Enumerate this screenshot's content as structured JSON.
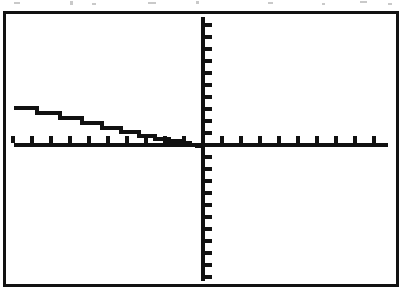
{
  "screen": {
    "label": "graphing-calculator-screen",
    "width": 406,
    "height": 300,
    "background_color": "#ffffff",
    "frame_color": "#121212",
    "frame_border_width": 3,
    "trace_color": "#111111",
    "axis_color": "#111111",
    "caption": "Graphing calculator display showing a decreasing step function in the second quadrant"
  },
  "artifacts": {
    "description": "faint grey scanner speckles along the top edge of the page",
    "color": "#c9c9c9",
    "specks": [
      {
        "x": 14,
        "y": 2,
        "w": 6,
        "h": 2
      },
      {
        "x": 70,
        "y": 1,
        "w": 3,
        "h": 4
      },
      {
        "x": 92,
        "y": 3,
        "w": 4,
        "h": 2
      },
      {
        "x": 148,
        "y": 2,
        "w": 8,
        "h": 2
      },
      {
        "x": 196,
        "y": 1,
        "w": 3,
        "h": 3
      },
      {
        "x": 268,
        "y": 2,
        "w": 5,
        "h": 2
      },
      {
        "x": 322,
        "y": 3,
        "w": 3,
        "h": 2
      },
      {
        "x": 360,
        "y": 1,
        "w": 7,
        "h": 2
      },
      {
        "x": 388,
        "y": 3,
        "w": 4,
        "h": 2
      }
    ]
  },
  "chart_data": {
    "type": "line",
    "title": "",
    "subtitle": "",
    "xlabel": "",
    "ylabel": "",
    "legend": [],
    "legend_position": "none",
    "grid": false,
    "axes_visible": true,
    "origin_px": {
      "x": 197,
      "y": 131
    },
    "xlim": [
      -10.2,
      10.2
    ],
    "ylim": [
      -11.5,
      11.5
    ],
    "x_tick_interval": 1,
    "y_tick_interval": 1,
    "x_tick_direction": "up",
    "y_tick_direction": "right",
    "x_ticks_left_of_origin": 10,
    "x_ticks_right_of_origin": 10,
    "y_ticks_above_origin": 11,
    "y_ticks_below_origin": 11,
    "series_name": "step-function",
    "series_style": "staircase",
    "description": "A monotonically decreasing staircase in the second quadrant; tread widths shrink as x approaches 0 and the curve descends to the origin.",
    "steps_px": [
      {
        "x_start": 8,
        "x_end": 31,
        "y": 92
      },
      {
        "x_start": 31,
        "x_end": 54,
        "y": 97
      },
      {
        "x_start": 54,
        "x_end": 76,
        "y": 102
      },
      {
        "x_start": 76,
        "x_end": 96,
        "y": 107
      },
      {
        "x_start": 96,
        "x_end": 115,
        "y": 112
      },
      {
        "x_start": 115,
        "x_end": 133,
        "y": 116
      },
      {
        "x_start": 133,
        "x_end": 149,
        "y": 120
      },
      {
        "x_start": 149,
        "x_end": 163,
        "y": 123
      },
      {
        "x_start": 163,
        "x_end": 175,
        "y": 125
      },
      {
        "x_start": 175,
        "x_end": 184,
        "y": 127
      },
      {
        "x_start": 184,
        "x_end": 191,
        "y": 129
      },
      {
        "x_start": 191,
        "x_end": 197,
        "y": 130
      }
    ],
    "points": [
      {
        "x": -9.6,
        "y": 2.9
      },
      {
        "x": -8.4,
        "y": 2.5
      },
      {
        "x": -7.3,
        "y": 2.1
      },
      {
        "x": -6.1,
        "y": 1.8
      },
      {
        "x": -5.1,
        "y": 1.4
      },
      {
        "x": -4.2,
        "y": 1.1
      },
      {
        "x": -3.3,
        "y": 0.8
      },
      {
        "x": -2.4,
        "y": 0.6
      },
      {
        "x": -1.7,
        "y": 0.4
      },
      {
        "x": -1.1,
        "y": 0.3
      },
      {
        "x": -0.6,
        "y": 0.15
      },
      {
        "x": -0.2,
        "y": 0.05
      },
      {
        "x": 0.0,
        "y": 0.0
      }
    ]
  }
}
